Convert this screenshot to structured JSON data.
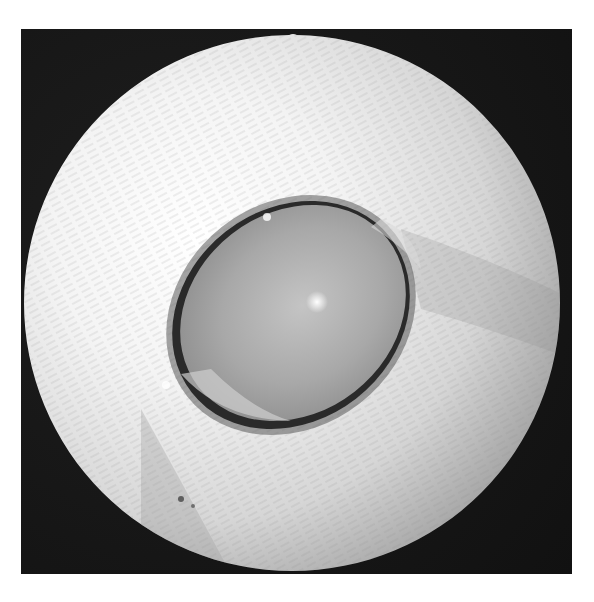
{
  "image": {
    "subject": "close-up photograph of an animal eye (cat) with clouded cornea, circular endoscope-style vignette",
    "colors": {
      "background": "#ffffff",
      "frame": "#151515",
      "fur_light": "#f2f2f2",
      "fur_mid": "#c8c8c8",
      "cornea": "#a9a9a9",
      "eyelid_rim": "#2a2a2a",
      "highlight": "#ffffff"
    },
    "alt": "Grayscale circular photograph of a cat's eye with a hazy, opaque cornea and a bright specular highlight"
  }
}
